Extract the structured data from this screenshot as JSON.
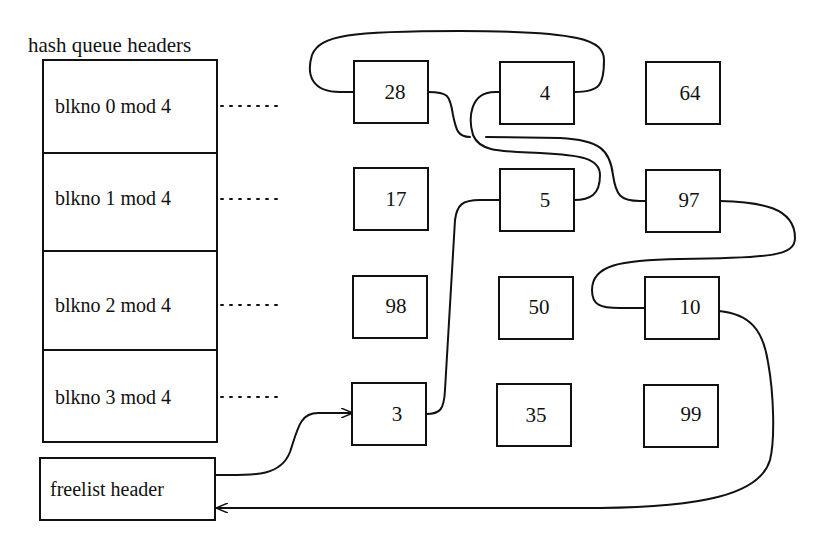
{
  "title": "hash queue headers",
  "hash_queue_headers": [
    {
      "label": "blkno 0 mod 4"
    },
    {
      "label": "blkno 1 mod 4"
    },
    {
      "label": "blkno 2 mod 4"
    },
    {
      "label": "blkno 3 mod 4"
    }
  ],
  "freelist": {
    "label": "freelist header"
  },
  "blocks": {
    "rows": [
      [
        "28",
        "4",
        "64"
      ],
      [
        "17",
        "5",
        "97"
      ],
      [
        "98",
        "50",
        "10"
      ],
      [
        "3",
        "35",
        "99"
      ]
    ]
  },
  "freelist_order": [
    "3",
    "5",
    "4",
    "28",
    "97",
    "10"
  ],
  "colors": {
    "line": "#111111",
    "background": "#ffffff"
  }
}
